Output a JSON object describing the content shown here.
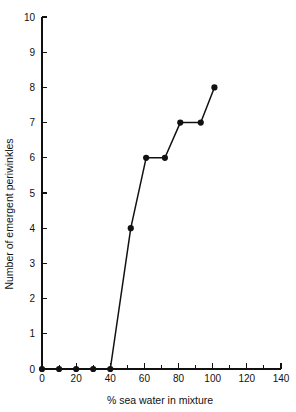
{
  "chart_data": {
    "type": "line",
    "title": "",
    "xlabel": "% sea water in mixture",
    "ylabel": "Number of emergent periwinkles",
    "xlim": [
      0,
      140
    ],
    "ylim": [
      0,
      10
    ],
    "grid": false,
    "legend": "none",
    "marker": "filled-circle",
    "x": [
      0,
      10,
      20,
      30,
      40,
      52,
      61,
      72,
      81,
      93,
      101
    ],
    "values": [
      0,
      0,
      0,
      0,
      0,
      4,
      6,
      6,
      7,
      7,
      8
    ],
    "series": [
      {
        "name": "emergent periwinkles",
        "x": [
          0,
          10,
          20,
          30,
          40,
          52,
          61,
          72,
          81,
          93,
          101
        ],
        "values": [
          0,
          0,
          0,
          0,
          0,
          4,
          6,
          6,
          7,
          7,
          8
        ]
      }
    ],
    "xticks": [
      0,
      20,
      40,
      60,
      80,
      100,
      120,
      140
    ],
    "xticklabels": [
      "0",
      "20",
      "40",
      "60",
      "80",
      "100",
      "120",
      "140"
    ],
    "xminorticks": [
      10,
      30,
      50,
      70,
      90,
      110,
      130
    ],
    "yticks": [
      0,
      1,
      2,
      3,
      4,
      5,
      6,
      7,
      8,
      9,
      10
    ],
    "yticklabels": [
      "0",
      "1",
      "2",
      "3",
      "4",
      "5",
      "6",
      "7",
      "8",
      "9",
      "10"
    ],
    "colors": {
      "line": "#111111",
      "marker": "#111111",
      "axis": "#111111",
      "background": "#ffffff"
    }
  }
}
